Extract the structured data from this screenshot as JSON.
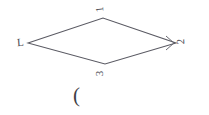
{
  "figure": {
    "type": "rhombus-diagram",
    "background_color": "#ffffff",
    "stroke_color": "#5a5a63",
    "label_color": "#4a4a52",
    "stroke_width": 1,
    "vertices": [
      {
        "name": "top",
        "label": "1",
        "x": 103,
        "y": 18
      },
      {
        "name": "right",
        "label": "2",
        "x": 176,
        "y": 43
      },
      {
        "name": "bottom",
        "label": "3",
        "x": 105,
        "y": 64
      },
      {
        "name": "left",
        "label": "L",
        "x": 28,
        "y": 43
      }
    ],
    "edges": [
      {
        "from": "left",
        "to": "top"
      },
      {
        "from": "top",
        "to": "right"
      },
      {
        "from": "right",
        "to": "bottom"
      },
      {
        "from": "bottom",
        "to": "left"
      }
    ],
    "angle_marker": {
      "at_vertex": "right",
      "kind": "angle-arc",
      "points": "166,36 174,43 166,50"
    }
  },
  "caption": {
    "text": "("
  }
}
